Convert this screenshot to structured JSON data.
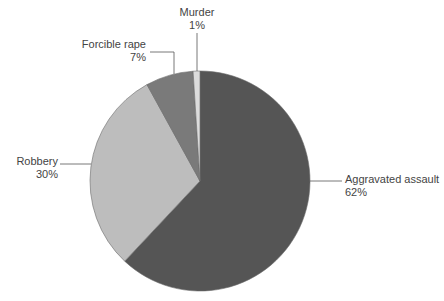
{
  "chart_data": {
    "type": "pie",
    "title": "",
    "start_angle_deg": 0,
    "direction": "clockwise",
    "slices": [
      {
        "label": "Aggravated assault",
        "value": 62,
        "pct_label": "62%",
        "color": "#555555"
      },
      {
        "label": "Robbery",
        "value": 30,
        "pct_label": "30%",
        "color": "#bdbdbd"
      },
      {
        "label": "Forcible rape",
        "value": 7,
        "pct_label": "7%",
        "color": "#7a7a7a"
      },
      {
        "label": "Murder",
        "value": 1,
        "pct_label": "1%",
        "color": "#dcdcdc"
      }
    ],
    "legend": "none (direct leader-line labels)"
  },
  "labels": {
    "murder": {
      "name": "Murder",
      "pct": "1%"
    },
    "rape": {
      "name": "Forcible rape",
      "pct": "7%"
    },
    "robbery": {
      "name": "Robbery",
      "pct": "30%"
    },
    "assault": {
      "name": "Aggravated assault",
      "pct": "62%"
    }
  }
}
